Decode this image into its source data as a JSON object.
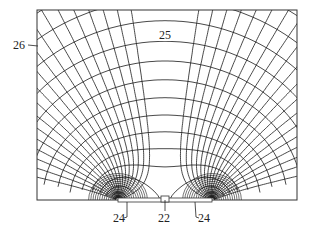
{
  "figure": {
    "type": "electric field / equipotential line drawing",
    "frame": {
      "x0": 37,
      "y0": 10,
      "x1": 297,
      "y1": 200
    },
    "line_color": "#1a1a1a",
    "labels": [
      {
        "id": "26",
        "text": "26",
        "x": 13,
        "y": 49,
        "leader": [
          [
            28,
            45
          ],
          [
            38,
            46
          ]
        ]
      },
      {
        "id": "25",
        "text": "25",
        "x": 159,
        "y": 39
      },
      {
        "id": "24a",
        "text": "24",
        "x": 113,
        "y": 222,
        "leader": [
          [
            124,
            218
          ],
          [
            127,
            217
          ],
          [
            127,
            202
          ]
        ]
      },
      {
        "id": "22",
        "text": "22",
        "x": 158,
        "y": 222,
        "leader": [
          [
            165,
            211
          ],
          [
            165,
            200
          ]
        ]
      },
      {
        "id": "24b",
        "text": "24",
        "x": 198,
        "y": 222,
        "leader": [
          [
            199,
            218
          ],
          [
            196,
            217
          ],
          [
            195,
            202
          ]
        ]
      }
    ],
    "electrodes": {
      "left_focus_x": 118,
      "right_focus_x": 212,
      "center_x": 165,
      "baseline_y": 200
    }
  }
}
